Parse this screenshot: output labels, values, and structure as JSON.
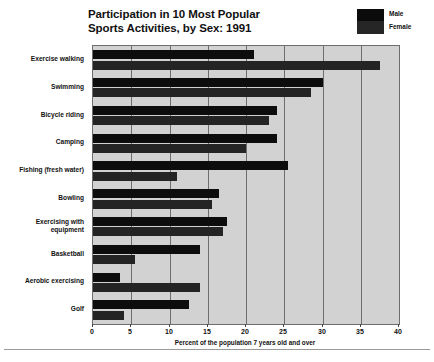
{
  "title": {
    "line1": "Participation in 10 Most Popular",
    "line2": "Sports Activities, by Sex: 1991"
  },
  "legend": {
    "position": "top-right",
    "swatch_icon": "legend-swatch-icon",
    "items": [
      {
        "label": "Male",
        "color": "#0d0d0d"
      },
      {
        "label": "Female",
        "color": "#242424"
      }
    ]
  },
  "axis": {
    "x_title": "Percent of the population 7 years old and over",
    "x_ticks": [
      "0",
      "5",
      "10",
      "15",
      "20",
      "25",
      "30",
      "35",
      "40"
    ]
  },
  "chart_data": {
    "type": "bar",
    "orientation": "horizontal",
    "grouped": true,
    "title": "Participation in 10 Most Popular Sports Activities, by Sex: 1991",
    "xlabel": "Percent of the population 7 years old and over",
    "ylabel": "",
    "xlim": [
      0,
      40
    ],
    "xticks": [
      0,
      5,
      10,
      15,
      20,
      25,
      30,
      35,
      40
    ],
    "grid": "vertical",
    "legend_position": "top-right",
    "categories": [
      "Exercise walking",
      "Swimming",
      "Bicycle riding",
      "Camping",
      "Fishing (fresh water)",
      "Bowling",
      "Exercising with\nequipment",
      "Basketball",
      "Aerobic exercising",
      "Golf"
    ],
    "series": [
      {
        "name": "Male",
        "color": "#0d0d0d",
        "values": [
          21.0,
          30.0,
          24.0,
          24.0,
          25.5,
          16.5,
          17.5,
          14.0,
          3.5,
          12.5
        ]
      },
      {
        "name": "Female",
        "color": "#242424",
        "values": [
          37.5,
          28.5,
          23.0,
          20.0,
          11.0,
          15.5,
          17.0,
          5.5,
          14.0,
          4.0
        ]
      }
    ]
  }
}
